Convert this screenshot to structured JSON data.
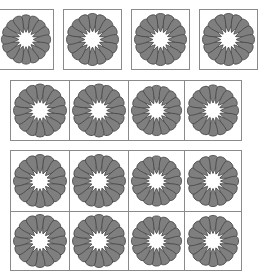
{
  "figure": {
    "petal_count": 16,
    "colors": {
      "petal_fill": "#7f7f7f",
      "petal_stroke": "#4a4a4a",
      "border": "#8a8a8a",
      "background": "#ffffff"
    },
    "groups": [
      {
        "name": "separated-row",
        "rows": 1,
        "cols": 4,
        "tiles": [
          {
            "x": -2,
            "y": 9,
            "w": 56,
            "h": 61
          },
          {
            "x": 63,
            "y": 9,
            "w": 59,
            "h": 61
          },
          {
            "x": 131,
            "y": 9,
            "w": 59,
            "h": 61
          },
          {
            "x": 199,
            "y": 9,
            "w": 59,
            "h": 61
          }
        ]
      },
      {
        "name": "joined-row",
        "rows": 1,
        "cols": 4,
        "tiles": [
          {
            "x": 10,
            "y": 80,
            "w": 60,
            "h": 61
          },
          {
            "x": 69,
            "y": 80,
            "w": 60,
            "h": 61
          },
          {
            "x": 128,
            "y": 80,
            "w": 57,
            "h": 61
          },
          {
            "x": 184,
            "y": 80,
            "w": 58,
            "h": 61
          }
        ]
      },
      {
        "name": "joined-grid",
        "rows": 2,
        "cols": 4,
        "tiles": [
          {
            "x": 10,
            "y": 150,
            "w": 60,
            "h": 62
          },
          {
            "x": 69,
            "y": 150,
            "w": 60,
            "h": 62
          },
          {
            "x": 128,
            "y": 150,
            "w": 57,
            "h": 62
          },
          {
            "x": 184,
            "y": 150,
            "w": 58,
            "h": 62
          },
          {
            "x": 10,
            "y": 211,
            "w": 60,
            "h": 60
          },
          {
            "x": 69,
            "y": 211,
            "w": 60,
            "h": 60
          },
          {
            "x": 128,
            "y": 211,
            "w": 57,
            "h": 60
          },
          {
            "x": 184,
            "y": 211,
            "w": 58,
            "h": 60
          }
        ]
      }
    ]
  }
}
